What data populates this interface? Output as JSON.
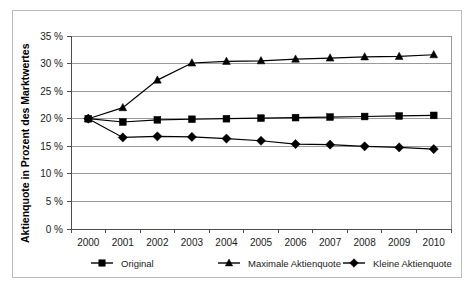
{
  "chart_data": {
    "type": "line",
    "title": "",
    "xlabel": "",
    "ylabel": "Aktienquote in Prozent des Marktwertes",
    "categories": [
      "2000",
      "2001",
      "2002",
      "2003",
      "2004",
      "2005",
      "2006",
      "2007",
      "2008",
      "2009",
      "2010"
    ],
    "ylim": [
      0,
      35
    ],
    "ytick_labels": [
      "0 %",
      "5 %",
      "10 %",
      "15 %",
      "20 %",
      "25 %",
      "30 %",
      "35 %"
    ],
    "ytick_values": [
      0,
      5,
      10,
      15,
      20,
      25,
      30,
      35
    ],
    "grid": true,
    "legend_position": "bottom",
    "series": [
      {
        "name": "Original",
        "marker": "square",
        "values": [
          20.0,
          19.4,
          19.8,
          19.9,
          20.0,
          20.1,
          20.2,
          20.3,
          20.4,
          20.5,
          20.6
        ]
      },
      {
        "name": "Maximale Aktienquote",
        "marker": "triangle",
        "values": [
          20.0,
          22.0,
          27.0,
          30.1,
          30.4,
          30.5,
          30.8,
          31.0,
          31.2,
          31.3,
          31.6
        ]
      },
      {
        "name": "Kleine Aktienquote",
        "marker": "diamond",
        "values": [
          20.0,
          16.6,
          16.8,
          16.7,
          16.4,
          16.0,
          15.4,
          15.3,
          15.0,
          14.8,
          14.5
        ]
      }
    ]
  },
  "colors": {
    "series": "#000000",
    "grid": "#9a9a9a",
    "axis": "#4d4d4d",
    "border": "#b9b9b9",
    "background": "#ffffff"
  }
}
